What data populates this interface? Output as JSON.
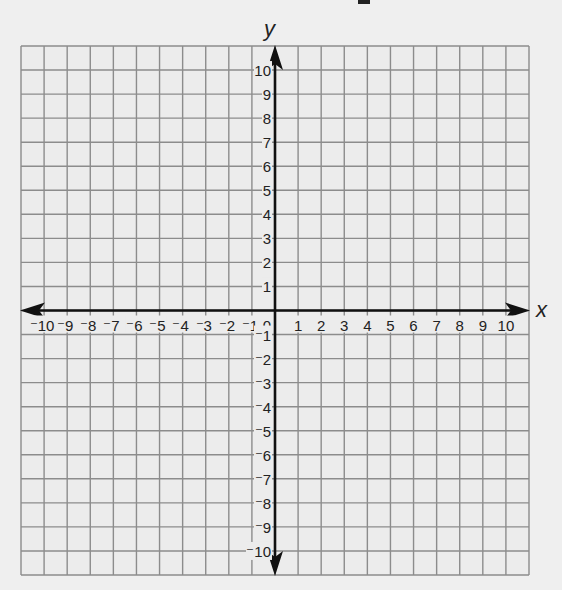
{
  "chart_data": {
    "type": "scatter",
    "title": "",
    "xlabel": "x",
    "ylabel": "y",
    "xlim": [
      -10,
      10
    ],
    "ylim": [
      -10,
      10
    ],
    "grid": true,
    "x_ticks": [
      -10,
      -9,
      -8,
      -7,
      -6,
      -5,
      -4,
      -3,
      -2,
      -1,
      0,
      1,
      2,
      3,
      4,
      5,
      6,
      7,
      8,
      9,
      10
    ],
    "y_ticks": [
      -10,
      -9,
      -8,
      -7,
      -6,
      -5,
      -4,
      -3,
      -2,
      -1,
      1,
      2,
      3,
      4,
      5,
      6,
      7,
      8,
      9,
      10
    ],
    "x_tick_labels": [
      "-10",
      "-9",
      "-8",
      "-7",
      "-6",
      "-5",
      "-4",
      "-3",
      "-2",
      "-1",
      "0",
      "1",
      "2",
      "3",
      "4",
      "5",
      "6",
      "7",
      "8",
      "9",
      "10"
    ],
    "y_tick_labels": [
      "10",
      "9",
      "8",
      "7",
      "6",
      "5",
      "4",
      "3",
      "2",
      "1",
      "-1",
      "-2",
      "-3",
      "-4",
      "-5",
      "-6",
      "-7",
      "-8",
      "-9",
      "-10"
    ],
    "points": [],
    "axes_arrows": true,
    "legend": null
  },
  "colors": {
    "background": "#efefef",
    "grid_fill": "#ececec",
    "grid_line": "#8c8c8c",
    "axis": "#111111",
    "text": "#222222"
  },
  "axes": {
    "x_label": "x",
    "y_label": "y",
    "origin_label": "0"
  }
}
